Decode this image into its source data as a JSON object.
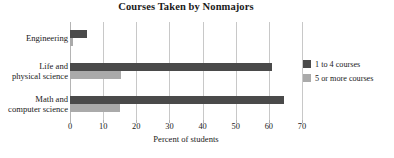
{
  "chart_data": {
    "type": "bar",
    "orientation": "horizontal",
    "title": "Courses Taken by Nonmajors",
    "xlabel": "Percent of students",
    "ylabel": "",
    "xlim": [
      0,
      70
    ],
    "xticks": [
      0,
      10,
      20,
      30,
      40,
      50,
      60,
      70
    ],
    "xtick_labels": [
      "0",
      "10",
      "20",
      "30",
      "40",
      "50",
      "60",
      "70"
    ],
    "grid": true,
    "legend_position": "right",
    "categories": [
      "Engineering",
      "Life and physical science",
      "Math and computer science"
    ],
    "category_label_lines": [
      [
        "Engineering"
      ],
      [
        "Life and",
        "physical science"
      ],
      [
        "Math and",
        "computer science"
      ]
    ],
    "series": [
      {
        "name": "1 to 4 courses",
        "color": "#4a4a4a",
        "values": [
          5,
          61,
          64.5
        ]
      },
      {
        "name": "5 or more courses",
        "color": "#aaaaaa",
        "values": [
          1,
          15.5,
          15
        ]
      }
    ]
  },
  "colors": {
    "series_dark": "#4a4a4a",
    "series_light": "#aaaaaa",
    "gridline": "#c8c8c8",
    "text": "#1a1a1a",
    "background": "#ffffff"
  }
}
